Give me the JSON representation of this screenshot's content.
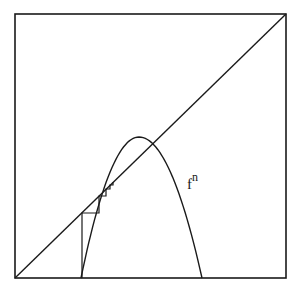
{
  "diagram": {
    "title": "",
    "curve_label": {
      "base": "f",
      "superscript": "n"
    },
    "box": {
      "x1": 15,
      "y1": 14,
      "x2": 286,
      "y2": 278
    },
    "diagonal": {
      "from": [
        15,
        278
      ],
      "to": [
        286,
        14
      ]
    },
    "curve": {
      "type": "parabola",
      "left_root": [
        81,
        278
      ],
      "vertex": [
        139,
        137
      ],
      "right_root": [
        202,
        278
      ]
    },
    "cobweb": [
      [
        82,
        278
      ],
      [
        82,
        213
      ],
      [
        99,
        213
      ],
      [
        99,
        196
      ],
      [
        106,
        196
      ],
      [
        106,
        189
      ],
      [
        110,
        189
      ],
      [
        110,
        185
      ],
      [
        113,
        185
      ],
      [
        113,
        182
      ]
    ],
    "colors": {
      "stroke": "#1a1a1a",
      "background": "#ffffff"
    }
  }
}
